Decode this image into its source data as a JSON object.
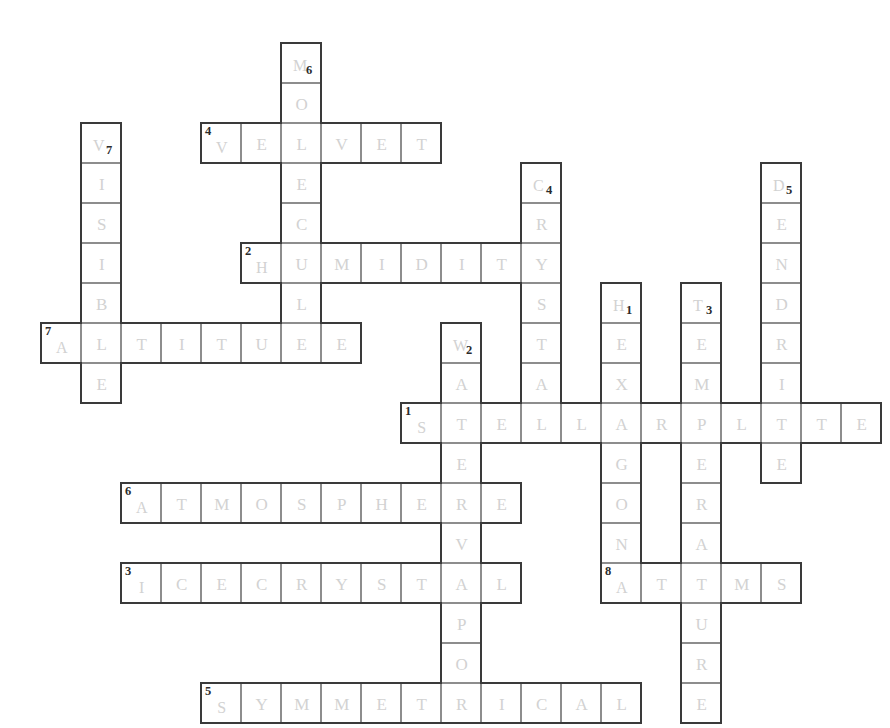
{
  "puzzle": {
    "title": "Snowflake Crossword Grid",
    "cell_size": 40,
    "origin_x": 41,
    "origin_y": 43,
    "grid_cols": 21,
    "grid_rows": 17,
    "letter_color": "#d2d2d2",
    "cell_border_color": "#8d8d8d",
    "outline_color": "#3a3a3a",
    "number_color": "#2b2b2b",
    "background_color": "#ffffff"
  },
  "entries": [
    {
      "number": "1",
      "answer": "STELLARPLATE",
      "direction": "across",
      "row": 9,
      "col": 9,
      "length": 12,
      "number_position": "top-left"
    },
    {
      "number": "2",
      "answer": "HUMIDITY",
      "direction": "across",
      "row": 5,
      "col": 5,
      "length": 8,
      "number_position": "top-left"
    },
    {
      "number": "3",
      "answer": "ICECRYSTAL",
      "direction": "across",
      "row": 13,
      "col": 2,
      "length": 10,
      "number_position": "top-left"
    },
    {
      "number": "4",
      "answer": "VELVET",
      "direction": "across",
      "row": 2,
      "col": 4,
      "length": 6,
      "number_position": "top-left"
    },
    {
      "number": "5",
      "answer": "SYMMETRICAL",
      "direction": "across",
      "row": 16,
      "col": 4,
      "length": 11,
      "number_position": "top-left"
    },
    {
      "number": "6",
      "answer": "ATMOSPHERE",
      "direction": "across",
      "row": 11,
      "col": 2,
      "length": 10,
      "number_position": "top-left"
    },
    {
      "number": "7",
      "answer": "ALTITUDE",
      "direction": "across",
      "row": 7,
      "col": 0,
      "length": 8,
      "number_position": "top-left"
    },
    {
      "number": "8",
      "answer": "ATOMS",
      "direction": "across",
      "row": 13,
      "col": 14,
      "length": 5,
      "number_position": "top-left"
    },
    {
      "number": "1",
      "answer": "HEXAGON",
      "direction": "down",
      "row": 6,
      "col": 14,
      "length": 7,
      "number_position": "subscript"
    },
    {
      "number": "2",
      "answer": "WATERVAPOR",
      "direction": "down",
      "row": 7,
      "col": 10,
      "length": 10,
      "number_position": "subscript"
    },
    {
      "number": "3",
      "answer": "TEMPERATURE",
      "direction": "down",
      "row": 6,
      "col": 16,
      "length": 11,
      "number_position": "subscript"
    },
    {
      "number": "4",
      "answer": "CRYSTAL",
      "direction": "down",
      "row": 3,
      "col": 12,
      "length": 7,
      "number_position": "subscript"
    },
    {
      "number": "5",
      "answer": "DENDRITE",
      "direction": "down",
      "row": 3,
      "col": 18,
      "length": 8,
      "number_position": "subscript"
    },
    {
      "number": "6",
      "answer": "MOLECULE",
      "direction": "down",
      "row": 0,
      "col": 6,
      "length": 8,
      "number_position": "subscript"
    },
    {
      "number": "7",
      "answer": "VISIBLE",
      "direction": "down",
      "row": 2,
      "col": 1,
      "length": 7,
      "number_position": "subscript"
    }
  ]
}
